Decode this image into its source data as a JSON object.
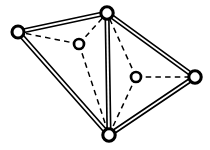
{
  "diagram": {
    "type": "node-link-graph",
    "canvas": {
      "width": 210,
      "height": 150,
      "background": "#ffffff"
    },
    "style": {
      "edge_color": "#000000",
      "node_fill": "#ffffff",
      "node_stroke": "#000000",
      "solid_edge_rendering": "double-line",
      "dashed_edge_pattern": "5.5 4.2"
    },
    "nodes": [
      {
        "id": "left",
        "label": "",
        "x": 18,
        "y": 32,
        "r": 6.0,
        "kind": "outer"
      },
      {
        "id": "top",
        "label": "",
        "x": 107,
        "y": 13,
        "r": 6.2,
        "kind": "outer"
      },
      {
        "id": "right",
        "label": "",
        "x": 195,
        "y": 77,
        "r": 6.2,
        "kind": "outer"
      },
      {
        "id": "bottom",
        "label": "",
        "x": 109,
        "y": 135,
        "r": 6.2,
        "kind": "outer"
      },
      {
        "id": "interior1",
        "label": "",
        "x": 79,
        "y": 44,
        "r": 5.0,
        "kind": "inner"
      },
      {
        "id": "interior2",
        "label": "",
        "x": 136,
        "y": 77,
        "r": 5.0,
        "kind": "inner"
      }
    ],
    "edges_solid": [
      {
        "from": "left",
        "to": "top",
        "x1": 18,
        "y1": 32,
        "x2": 107,
        "y2": 13
      },
      {
        "from": "top",
        "to": "right",
        "x1": 107,
        "y1": 13,
        "x2": 195,
        "y2": 77
      },
      {
        "from": "right",
        "to": "bottom",
        "x1": 195,
        "y1": 77,
        "x2": 109,
        "y2": 135
      },
      {
        "from": "bottom",
        "to": "left",
        "x1": 109,
        "y1": 135,
        "x2": 18,
        "y2": 32
      },
      {
        "from": "top",
        "to": "bottom",
        "x1": 107,
        "y1": 13,
        "x2": 109,
        "y2": 135
      }
    ],
    "edges_dashed": [
      {
        "from": "interior1",
        "to": "left",
        "x1": 79,
        "y1": 44,
        "x2": 18,
        "y2": 32
      },
      {
        "from": "interior1",
        "to": "top",
        "x1": 79,
        "y1": 44,
        "x2": 107,
        "y2": 13
      },
      {
        "from": "interior1",
        "to": "bottom",
        "x1": 79,
        "y1": 44,
        "x2": 109,
        "y2": 135
      },
      {
        "from": "interior2",
        "to": "top",
        "x1": 136,
        "y1": 77,
        "x2": 107,
        "y2": 13
      },
      {
        "from": "interior2",
        "to": "right",
        "x1": 136,
        "y1": 77,
        "x2": 195,
        "y2": 77
      },
      {
        "from": "interior2",
        "to": "bottom",
        "x1": 136,
        "y1": 77,
        "x2": 109,
        "y2": 135
      }
    ]
  }
}
